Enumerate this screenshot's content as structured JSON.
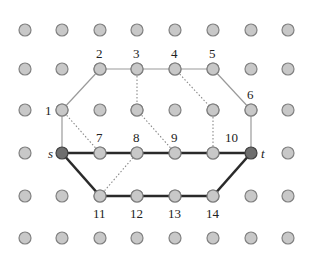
{
  "diagram": {
    "type": "grid-graph",
    "grid": {
      "columns_x": [
        25,
        62,
        100,
        137,
        175,
        213,
        251,
        288
      ],
      "rows_y": [
        30,
        69,
        110,
        153,
        196,
        238
      ],
      "dot_radius": 6,
      "dot_fill": "#c8c8c8",
      "dot_stroke": "#808080"
    },
    "nodes": [
      {
        "id": "s",
        "label": "s",
        "col": 1,
        "row": 3,
        "special": true,
        "label_dx": -14,
        "label_dy": 5
      },
      {
        "id": "t",
        "label": "t",
        "col": 6,
        "row": 3,
        "special": true,
        "label_dx": 10,
        "label_dy": 5
      },
      {
        "id": "1",
        "label": "1",
        "col": 1,
        "row": 2,
        "label_dx": -17,
        "label_dy": 5
      },
      {
        "id": "2",
        "label": "2",
        "col": 2,
        "row": 1,
        "label_dx": -4,
        "label_dy": -11
      },
      {
        "id": "3",
        "label": "3",
        "col": 3,
        "row": 1,
        "label_dx": -4,
        "label_dy": -11
      },
      {
        "id": "4",
        "label": "4",
        "col": 4,
        "row": 1,
        "label_dx": -4,
        "label_dy": -11
      },
      {
        "id": "5",
        "label": "5",
        "col": 5,
        "row": 1,
        "label_dx": -4,
        "label_dy": -11
      },
      {
        "id": "6",
        "label": "6",
        "col": 6,
        "row": 2,
        "label_dx": -4,
        "label_dy": -11
      },
      {
        "id": "7",
        "label": "7",
        "col": 2,
        "row": 3,
        "label_dx": -4,
        "label_dy": -11
      },
      {
        "id": "8",
        "label": "8",
        "col": 3,
        "row": 3,
        "label_dx": -4,
        "label_dy": -11
      },
      {
        "id": "9",
        "label": "9",
        "col": 4,
        "row": 3,
        "label_dx": -4,
        "label_dy": -11
      },
      {
        "id": "10",
        "label": "10",
        "col": 5,
        "row": 3,
        "label_dx": 12,
        "label_dy": -11
      },
      {
        "id": "11",
        "label": "11",
        "col": 2,
        "row": 4,
        "label_dx": -7,
        "label_dy": 22
      },
      {
        "id": "12",
        "label": "12",
        "col": 3,
        "row": 4,
        "label_dx": -7,
        "label_dy": 22
      },
      {
        "id": "13",
        "label": "13",
        "col": 4,
        "row": 4,
        "label_dx": -7,
        "label_dy": 22
      },
      {
        "id": "14",
        "label": "14",
        "col": 5,
        "row": 4,
        "label_dx": -7,
        "label_dy": 22
      },
      {
        "id": "m1",
        "label": "",
        "col": 3,
        "row": 2
      },
      {
        "id": "m2",
        "label": "",
        "col": 5,
        "row": 2
      }
    ],
    "edges": [
      {
        "from": "1",
        "to": "2",
        "style": "thin"
      },
      {
        "from": "2",
        "to": "3",
        "style": "thin"
      },
      {
        "from": "3",
        "to": "4",
        "style": "thin"
      },
      {
        "from": "4",
        "to": "5",
        "style": "thin"
      },
      {
        "from": "5",
        "to": "6",
        "style": "thin"
      },
      {
        "from": "1",
        "to": "s",
        "style": "thin"
      },
      {
        "from": "6",
        "to": "t",
        "style": "thin"
      },
      {
        "from": "1",
        "to": "7",
        "style": "dotted"
      },
      {
        "from": "3",
        "to": "m1",
        "style": "dotted"
      },
      {
        "from": "m1",
        "to": "9",
        "style": "dotted"
      },
      {
        "from": "4",
        "to": "m2",
        "style": "dotted"
      },
      {
        "from": "m2",
        "to": "10",
        "style": "dotted"
      },
      {
        "from": "11",
        "to": "8",
        "style": "dotted"
      },
      {
        "from": "s",
        "to": "7",
        "style": "thick"
      },
      {
        "from": "7",
        "to": "8",
        "style": "thick"
      },
      {
        "from": "8",
        "to": "9",
        "style": "thick"
      },
      {
        "from": "9",
        "to": "10",
        "style": "thick"
      },
      {
        "from": "10",
        "to": "t",
        "style": "thick"
      },
      {
        "from": "s",
        "to": "11",
        "style": "thick"
      },
      {
        "from": "11",
        "to": "12",
        "style": "thick"
      },
      {
        "from": "12",
        "to": "13",
        "style": "thick"
      },
      {
        "from": "13",
        "to": "14",
        "style": "thick"
      },
      {
        "from": "14",
        "to": "t",
        "style": "thick"
      }
    ],
    "colors": {
      "thin_edge": "#9a9a9a",
      "dotted_edge": "#8a8a8a",
      "thick_edge": "#2a2a2a",
      "special_fill": "#6e6e6e",
      "special_stroke": "#404040"
    }
  }
}
